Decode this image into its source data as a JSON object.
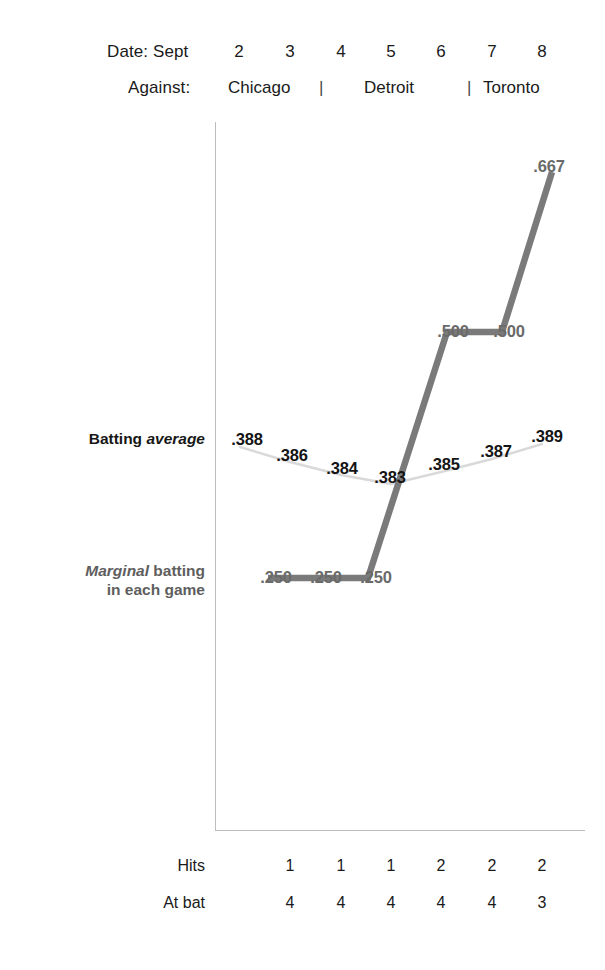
{
  "header": {
    "date_label": "Date: Sept",
    "dates": [
      "2",
      "3",
      "4",
      "5",
      "6",
      "7",
      "8"
    ],
    "against_label": "Against:",
    "opponents": [
      "Chicago",
      "Detroit",
      "Toronto"
    ],
    "separator": "|"
  },
  "series_labels": {
    "average_prefix": "Batting ",
    "average_emph": "average",
    "marginal_emph": "Marginal",
    "marginal_rest": " batting",
    "marginal_line2": "in each game"
  },
  "table": {
    "hits_label": "Hits",
    "atbat_label": "At bat",
    "hits": [
      "1",
      "1",
      "1",
      "2",
      "2",
      "2"
    ],
    "at_bat": [
      "4",
      "4",
      "4",
      "4",
      "4",
      "3"
    ]
  },
  "colors": {
    "average_line": "#d9d9d9",
    "marginal_line": "#7a7a7a",
    "axis": "#bdbdbd",
    "text": "#1a1a1a",
    "marginal_text": "#6a6a6a"
  },
  "chart_data": {
    "type": "line",
    "title": "",
    "xlabel": "Date: Sept",
    "ylabel": "",
    "x": [
      "2",
      "3",
      "4",
      "5",
      "6",
      "7",
      "8"
    ],
    "grid": false,
    "legend": "inline-left",
    "series": [
      {
        "name": "Batting average",
        "color": "#d9d9d9",
        "label_color": "#141414",
        "x": [
          "2",
          "3",
          "4",
          "5",
          "6",
          "7",
          "8"
        ],
        "values": [
          0.388,
          0.386,
          0.384,
          0.383,
          0.385,
          0.387,
          0.389
        ],
        "labels": [
          ".388",
          ".386",
          ".384",
          ".383",
          ".385",
          ".387",
          ".389"
        ],
        "points_px": [
          {
            "x": 240,
            "y": 447
          },
          {
            "x": 290,
            "y": 462
          },
          {
            "x": 341,
            "y": 475
          },
          {
            "x": 391,
            "y": 484
          },
          {
            "x": 441,
            "y": 472
          },
          {
            "x": 492,
            "y": 459
          },
          {
            "x": 542,
            "y": 444
          }
        ],
        "label_px": [
          {
            "x": 247,
            "y": 440
          },
          {
            "x": 292,
            "y": 456
          },
          {
            "x": 342,
            "y": 469
          },
          {
            "x": 390,
            "y": 478
          },
          {
            "x": 444,
            "y": 465
          },
          {
            "x": 496,
            "y": 452
          },
          {
            "x": 547,
            "y": 437
          }
        ]
      },
      {
        "name": "Marginal batting in each game",
        "color": "#7a7a7a",
        "label_color": "#6a6a6a",
        "x": [
          "3",
          "4",
          "5",
          "6",
          "7",
          "8"
        ],
        "values": [
          0.25,
          0.25,
          0.25,
          0.5,
          0.5,
          0.667
        ],
        "labels": [
          ".250",
          ".250",
          ".250",
          ".500",
          ".500",
          ".667"
        ],
        "points_px": [
          {
            "x": 268,
            "y": 578
          },
          {
            "x": 318,
            "y": 578
          },
          {
            "x": 368,
            "y": 578
          },
          {
            "x": 447,
            "y": 332
          },
          {
            "x": 502,
            "y": 332
          },
          {
            "x": 552,
            "y": 172
          }
        ],
        "label_px": [
          {
            "x": 276,
            "y": 578
          },
          {
            "x": 326,
            "y": 578
          },
          {
            "x": 376,
            "y": 578
          },
          {
            "x": 453,
            "y": 332
          },
          {
            "x": 509,
            "y": 332
          },
          {
            "x": 549,
            "y": 167
          }
        ]
      }
    ],
    "annotations": {
      "hits": [
        1,
        1,
        1,
        2,
        2,
        2
      ],
      "at_bat": [
        4,
        4,
        4,
        4,
        4,
        3
      ],
      "opponents": [
        "Chicago",
        "Chicago",
        "Detroit",
        "Detroit",
        "Detroit",
        "Toronto"
      ]
    },
    "axis_px": {
      "v_x": 215,
      "v_top": 122,
      "v_bottom": 831,
      "h_y": 830,
      "h_left": 215,
      "h_right": 585
    },
    "tick_px": [
      239,
      290,
      341,
      391,
      441,
      492,
      542
    ]
  }
}
